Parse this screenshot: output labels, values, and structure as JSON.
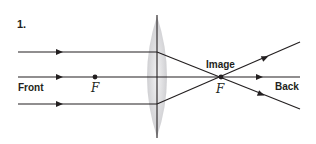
{
  "figure": {
    "number": "1.",
    "labels": {
      "front": "Front",
      "back": "Back",
      "image": "Image",
      "focal_left": "F",
      "focal_right": "F"
    },
    "colors": {
      "ray": "#231f20",
      "lens_fill": "#d9d9db",
      "text": "#231f20"
    },
    "rays": [
      {
        "name": "top",
        "incoming_y": 52,
        "outgoing_end": [
          300,
          42
        ]
      },
      {
        "name": "middle",
        "incoming_y": 77,
        "outgoing_end": [
          300,
          77
        ]
      },
      {
        "name": "bottom",
        "incoming_y": 104,
        "outgoing_end": [
          300,
          109
        ]
      }
    ],
    "lens": {
      "type": "convex",
      "x": 157,
      "top": 15,
      "bottom": 138
    },
    "focal_points": {
      "left": [
        95,
        77
      ],
      "right": [
        221,
        77
      ]
    }
  }
}
